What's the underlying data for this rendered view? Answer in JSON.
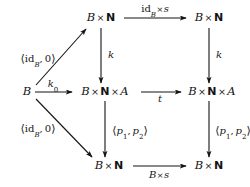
{
  "diagram": {
    "kind": "commutative-diagram",
    "title": "",
    "canvas": {
      "width": 250,
      "height": 187,
      "background": "#ffffff"
    },
    "ink_color": "#141414",
    "nodes": [
      {
        "id": "top-left",
        "label": "B × ℕ",
        "text": "B × N",
        "x": 101,
        "y": 18
      },
      {
        "id": "top-right",
        "label": "B × ℕ",
        "text": "B × N",
        "x": 209,
        "y": 18
      },
      {
        "id": "mid-far-left",
        "label": "B",
        "text": "B",
        "x": 27,
        "y": 92
      },
      {
        "id": "mid-left",
        "label": "B × ℕ × A",
        "text": "B × N × A",
        "x": 105,
        "y": 92
      },
      {
        "id": "mid-right",
        "label": "B × ℕ × A",
        "text": "B × N × A",
        "x": 212,
        "y": 92
      },
      {
        "id": "bot-left",
        "label": "B × ℕ",
        "text": "B × N",
        "x": 109,
        "y": 166
      },
      {
        "id": "bot-right",
        "label": "B × ℕ",
        "text": "B × N",
        "x": 209,
        "y": 166
      }
    ],
    "edges": [
      {
        "id": "top-horizontal",
        "from": "top-left",
        "to": "top-right",
        "label": "id_B × s",
        "label_position": "above"
      },
      {
        "id": "mid-horizontal-1",
        "from": "mid-far-left",
        "to": "mid-left",
        "label": "k_0",
        "label_position": "above"
      },
      {
        "id": "mid-horizontal-2",
        "from": "mid-left",
        "to": "mid-right",
        "label": "t",
        "label_position": "below"
      },
      {
        "id": "bot-horizontal",
        "from": "bot-left",
        "to": "bot-right",
        "label": "B × s",
        "label_position": "below"
      },
      {
        "id": "left-vertical-k",
        "from": "top-left",
        "to": "mid-left",
        "label": "k",
        "label_position": "right"
      },
      {
        "id": "right-vertical-k",
        "from": "top-right",
        "to": "mid-right",
        "label": "k",
        "label_position": "right"
      },
      {
        "id": "left-vertical-p",
        "from": "mid-left",
        "to": "bot-left",
        "label": "⟨p1, p2⟩",
        "label_position": "right"
      },
      {
        "id": "right-vertical-p",
        "from": "mid-right",
        "to": "bot-right",
        "label": "⟨p1, p2⟩",
        "label_position": "right"
      },
      {
        "id": "diagonal-up",
        "from": "mid-far-left",
        "to": "top-left",
        "label": "⟨id_B, 0⟩",
        "label_position": "left"
      },
      {
        "id": "diagonal-down",
        "from": "mid-far-left",
        "to": "bot-left",
        "label": "⟨id_B, 0⟩",
        "label_position": "left"
      }
    ],
    "label_text": {
      "id_b_times_s": "id_B × s",
      "k_zero": "k0",
      "t": "t",
      "b_times_s": "B × s",
      "k_left": "k",
      "k_right": "k",
      "p_pair_left": "⟨p1, p2⟩",
      "p_pair_right": "⟨p1, p2⟩",
      "id_pair_up": "⟨idB, 0⟩",
      "id_pair_down": "⟨idB, 0⟩"
    },
    "node_text": {
      "top_left": "B × N",
      "top_right": "B × N",
      "mid_far_left": "B",
      "mid_left": "B × N × A",
      "mid_right": "B × N × A",
      "bot_left": "B × N",
      "bot_right": "B × N"
    }
  }
}
